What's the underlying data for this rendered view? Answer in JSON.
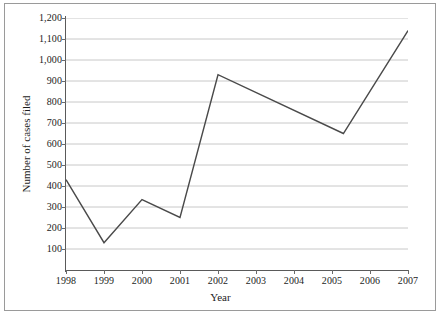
{
  "chart_data": {
    "type": "line",
    "title": "",
    "xlabel": "Year",
    "ylabel": "Number of cases filed",
    "x": [
      1998,
      1999,
      2000,
      2001,
      2002,
      2005.3,
      2007
    ],
    "values": [
      430,
      130,
      335,
      250,
      930,
      650,
      1140
    ],
    "series": [
      {
        "name": "Number of cases filed",
        "x": [
          1998,
          1999,
          2000,
          2001,
          2002,
          2005.3,
          2007
        ],
        "values": [
          430,
          130,
          335,
          250,
          930,
          650,
          1140
        ]
      }
    ],
    "xlim": [
      1998,
      2007
    ],
    "ylim": [
      0,
      1200
    ],
    "grid": true,
    "grid_axis": "y",
    "legend": "none",
    "line_color": "#4a4a4a",
    "grid_color": "#c8c8c8",
    "axis_color": "#5a5a5a",
    "background": "#ffffff",
    "xticklabels": [
      "1998",
      "1999",
      "2000",
      "2001",
      "2002",
      "2003",
      "2004",
      "2005",
      "2006",
      "2007"
    ],
    "xtickvalues": [
      1998,
      1999,
      2000,
      2001,
      2002,
      2003,
      2004,
      2005,
      2006,
      2007
    ],
    "yticklabels": [
      "100",
      "200",
      "300",
      "400",
      "500",
      "600",
      "700",
      "800",
      "900",
      "1,000",
      "1,100",
      "1,200"
    ],
    "ytickvalues": [
      100,
      200,
      300,
      400,
      500,
      600,
      700,
      800,
      900,
      1000,
      1100,
      1200
    ]
  }
}
